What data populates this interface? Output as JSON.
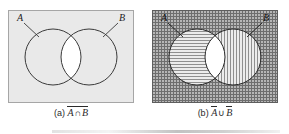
{
  "figure": {
    "type": "venn-diagram-pair",
    "background_color": "#ffffff",
    "panels": [
      {
        "id": "a",
        "caption_prefix": "(a)",
        "expression_overbar": "full",
        "expr_left": "A",
        "expr_operator": "∩",
        "expr_right": "B",
        "caption_plain": "(a) A ∩ B complement",
        "universe_label": "",
        "set_labels": {
          "left": "A",
          "right": "B"
        },
        "shading": {
          "universe_fill": "#e8e8e8",
          "left_circle_fill": "#e8e8e8",
          "right_circle_fill": "#e8e8e8",
          "intersection_fill": "#ffffff",
          "pattern_universe": "plain",
          "pattern_left": "plain",
          "pattern_right": "plain"
        },
        "stroke_color": "#3a3a3a",
        "border_color": "#9a9a9a"
      },
      {
        "id": "b",
        "caption_prefix": "(b)",
        "expression_overbar": "separate",
        "expr_left": "A",
        "expr_operator": "∪",
        "expr_right": "B",
        "caption_plain": "(b) A complement ∪ B complement",
        "universe_label": "",
        "set_labels": {
          "left": "A",
          "right": "B"
        },
        "shading": {
          "universe_fill": "#9a9a9a",
          "left_circle_fill": "#dedede",
          "right_circle_fill": "#cfcfcf",
          "intersection_fill": "#ffffff",
          "pattern_universe": "cross-hatch",
          "pattern_left": "horizontal-hatch",
          "pattern_right": "vertical-hatch"
        },
        "stroke_color": "#2a2a2a",
        "border_color": "#6a6a6a"
      }
    ],
    "geometry": {
      "panel_width": 126,
      "panel_height": 93,
      "left_circle_cx": 45,
      "right_circle_cx": 81,
      "circle_cy": 47,
      "circle_r": 28
    }
  }
}
